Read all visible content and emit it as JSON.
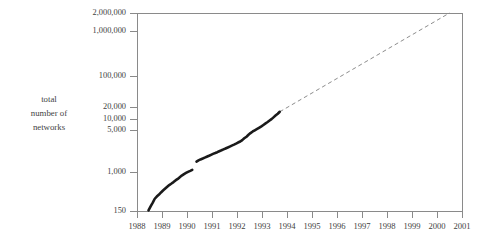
{
  "chart_data": {
    "type": "line",
    "title": "",
    "xlabel": "",
    "ylabel": "total number of networks",
    "ylabel_lines": [
      "total",
      "number of",
      "networks"
    ],
    "yscale": "log",
    "ylim": [
      150,
      2000000
    ],
    "xlim": [
      1988,
      2001
    ],
    "grid": false,
    "legend": null,
    "ytick_labels": [
      "2,000,000",
      "1,000,000",
      "100,000",
      "20,000",
      "10,000",
      "5,000",
      "1,000",
      "150"
    ],
    "ytick_values": [
      2000000,
      1000000,
      100000,
      20000,
      10000,
      5000,
      1000,
      150
    ],
    "xtick_labels": [
      "1988",
      "1989",
      "1990",
      "1991",
      "1992",
      "1993",
      "1994",
      "1995",
      "1996",
      "1997",
      "1998",
      "1999",
      "2000",
      "2001"
    ],
    "xtick_values": [
      1988,
      1989,
      1990,
      1991,
      1992,
      1993,
      1994,
      1995,
      1996,
      1997,
      1998,
      1999,
      2000,
      2001
    ],
    "series": [
      {
        "name": "observed networks",
        "style": "solid-thick",
        "color": "#1a1a1a",
        "x": [
          1988.46,
          1988.55,
          1988.63,
          1988.71,
          1988.79,
          1988.88,
          1988.96,
          1989.04,
          1989.13,
          1989.21,
          1989.29,
          1989.38,
          1989.46,
          1989.54,
          1989.63,
          1989.71,
          1989.79,
          1989.88,
          1989.96,
          1990.04,
          1990.13,
          1990.21,
          1990.38,
          1990.46,
          1990.54,
          1990.63,
          1990.71,
          1990.79,
          1990.88,
          1990.96,
          1991.04,
          1991.13,
          1991.21,
          1991.29,
          1991.38,
          1991.46,
          1991.54,
          1991.63,
          1991.71,
          1991.79,
          1991.88,
          1991.96,
          1992.04,
          1992.13,
          1992.21,
          1992.29,
          1992.38,
          1992.46,
          1992.54,
          1992.63,
          1992.71,
          1992.79,
          1992.88,
          1992.96,
          1993.04,
          1993.13,
          1993.21,
          1993.29,
          1993.38,
          1993.46,
          1993.54,
          1993.63,
          1993.71
        ],
        "y": [
          155,
          190,
          225,
          270,
          300,
          330,
          365,
          400,
          440,
          480,
          520,
          560,
          600,
          650,
          700,
          760,
          820,
          880,
          930,
          980,
          1030,
          1080,
          1600,
          1700,
          1780,
          1860,
          1940,
          2020,
          2120,
          2220,
          2320,
          2420,
          2520,
          2640,
          2760,
          2880,
          3000,
          3150,
          3300,
          3460,
          3620,
          3800,
          4000,
          4200,
          4500,
          4900,
          5300,
          5800,
          6300,
          6800,
          7200,
          7600,
          8100,
          8600,
          9200,
          9900,
          10600,
          11400,
          12300,
          13400,
          14600,
          15900,
          17500
        ]
      },
      {
        "name": "projected growth",
        "style": "dashed",
        "color": "#8d8d8d",
        "x": [
          1993.71,
          2000.5
        ],
        "y": [
          17500,
          2000000
        ]
      }
    ]
  },
  "axes": {
    "frame_color": "#8a8a8a",
    "plot_left_px": 137,
    "plot_right_px": 462,
    "plot_top_px": 13,
    "plot_bottom_px": 211
  }
}
